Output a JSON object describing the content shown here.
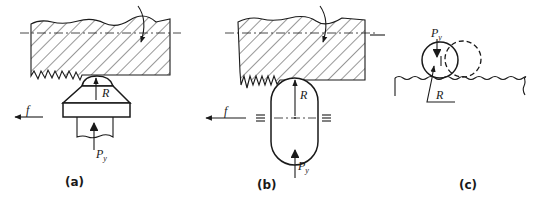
{
  "figure": {
    "panels": [
      {
        "id": "a",
        "caption": "(a)",
        "labels": {
          "radius": "R",
          "force": "P",
          "force_sub": "y",
          "feed": "f"
        },
        "description": "Hatched workpiece with rotation arrow and centerline; tool with dome tip on a trapezoid base and shank pushing up with force Py; feed direction f to the left"
      },
      {
        "id": "b",
        "caption": "(b)",
        "labels": {
          "radius": "R",
          "force": "P",
          "force_sub": "y",
          "feed": "f"
        },
        "description": "Hatched workpiece with rotation arrow; capsule-shaped roller with radius R, center marks and guide marks (≡) on both sides; force Py from below; feed f to the left"
      },
      {
        "id": "c",
        "caption": "(c)",
        "labels": {
          "radius": "R",
          "force": "P",
          "force_sub": "y"
        },
        "description": "Ball of radius R pressed onto wavy surface with force Py; dashed circle shows displaced position"
      }
    ],
    "colors": {
      "line": "#1a1a1a",
      "background": "#ffffff"
    }
  }
}
